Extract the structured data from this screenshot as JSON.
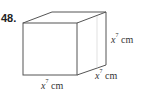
{
  "problem": {
    "number": "48.",
    "figure": "cube",
    "labels": {
      "height": {
        "base": "x",
        "exponent": "7",
        "unit": "cm"
      },
      "depth": {
        "base": "x",
        "exponent": "7",
        "unit": "cm"
      },
      "width": {
        "base": "x",
        "exponent": "7",
        "unit": "cm"
      }
    },
    "colors": {
      "stroke": "#555555",
      "text": "#333333",
      "background": "#ffffff"
    }
  }
}
